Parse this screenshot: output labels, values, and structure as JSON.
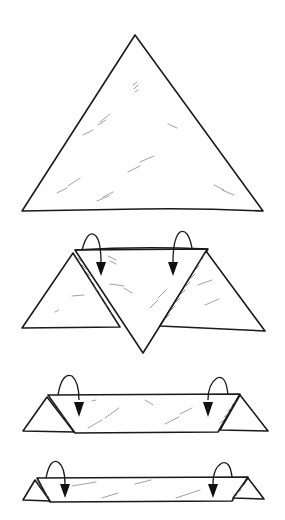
{
  "diagram": {
    "type": "folding-instructions",
    "steps": [
      {
        "name": "step-1",
        "shape": "triangle"
      },
      {
        "name": "step-2",
        "shape": "triangle-with-corners-folded",
        "arrows": 2
      },
      {
        "name": "step-3",
        "shape": "folded-band",
        "arrows": 2
      },
      {
        "name": "step-4",
        "shape": "narrow-folded-band",
        "arrows": 2
      }
    ],
    "colors": {
      "line": "#1a1a1a",
      "texture": "#8a8a8a",
      "paper": "#ffffff"
    }
  }
}
